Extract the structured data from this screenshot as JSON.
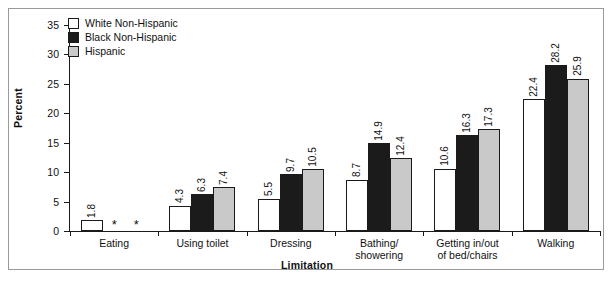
{
  "chart_data": {
    "type": "bar",
    "title": "",
    "subtitle": "",
    "xlabel": "Limitation",
    "ylabel": "Percent",
    "ylim": [
      0,
      35
    ],
    "yticks": [
      0,
      5,
      10,
      15,
      20,
      25,
      30,
      35
    ],
    "grid": false,
    "legend_position": "top-left",
    "orientation": "vertical",
    "grouping": "grouped",
    "value_labels": true,
    "value_label_rotation": "vertical",
    "suppressed_marker": "*",
    "categories": [
      "Eating",
      "Using toilet",
      "Dressing",
      "Bathing/ showering",
      "Getting in/out of bed/chairs",
      "Walking"
    ],
    "category_lines": [
      [
        "Eating"
      ],
      [
        "Using toilet"
      ],
      [
        "Dressing"
      ],
      [
        "Bathing/",
        "showering"
      ],
      [
        "Getting in/out",
        "of bed/chairs"
      ],
      [
        "Walking"
      ]
    ],
    "series": [
      {
        "name": "White Non-Hispanic",
        "color": "#ffffff",
        "swatch": "white",
        "values": [
          1.8,
          4.3,
          5.5,
          8.7,
          10.6,
          22.4
        ],
        "labels": [
          "1.8",
          "4.3",
          "5.5",
          "8.7",
          "10.6",
          "22.4"
        ]
      },
      {
        "name": "Black Non-Hispanic",
        "color": "#1b1b1b",
        "swatch": "black",
        "values": [
          null,
          6.3,
          9.7,
          14.9,
          16.3,
          28.2
        ],
        "labels": [
          "*",
          "6.3",
          "9.7",
          "14.9",
          "16.3",
          "28.2"
        ]
      },
      {
        "name": "Hispanic",
        "color": "#c9c9c9",
        "swatch": "gray",
        "values": [
          null,
          7.4,
          10.5,
          12.4,
          17.3,
          25.9
        ],
        "labels": [
          "*",
          "7.4",
          "10.5",
          "12.4",
          "17.3",
          "25.9"
        ]
      }
    ]
  },
  "axes": {
    "y_title": "Percent",
    "x_title": "Limitation",
    "y_tick_labels": [
      "0",
      "5",
      "10",
      "15",
      "20",
      "25",
      "30",
      "35"
    ]
  },
  "legend": {
    "items": [
      {
        "label": "White Non-Hispanic",
        "swatch": "white"
      },
      {
        "label": "Black Non-Hispanic",
        "swatch": "black"
      },
      {
        "label": "Hispanic",
        "swatch": "gray"
      }
    ]
  }
}
